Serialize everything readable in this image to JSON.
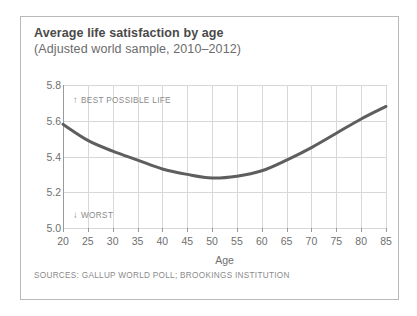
{
  "card": {
    "title": "Average life satisfaction by age",
    "subtitle": "(Adjusted world sample, 2010–2012)",
    "source": "SOURCES: GALLUP WORLD POLL; BROOKINGS INSTITUTION",
    "border_color": "#b9b9b9",
    "background": "#ffffff"
  },
  "annotations": {
    "top": {
      "arrow": "↑",
      "label": "BEST POSSIBLE LIFE"
    },
    "bottom": {
      "arrow": "↓",
      "label": "WORST"
    }
  },
  "chart_data": {
    "type": "line",
    "title": "Average life satisfaction by age",
    "subtitle": "(Adjusted world sample, 2010–2012)",
    "xlabel": "Age",
    "ylabel": "",
    "xlim": [
      20,
      85
    ],
    "ylim": [
      5.0,
      5.8
    ],
    "grid": true,
    "legend": false,
    "line_color": "#5e5e5e",
    "line_width": 3,
    "xticks": [
      20,
      25,
      30,
      35,
      40,
      45,
      50,
      55,
      60,
      65,
      70,
      75,
      80,
      85
    ],
    "xticklabels": [
      "20",
      "25",
      "30",
      "35",
      "40",
      "45",
      "50",
      "55",
      "60",
      "65",
      "70",
      "75",
      "80",
      "85"
    ],
    "yticks": [
      5.0,
      5.2,
      5.4,
      5.6,
      5.8
    ],
    "yticklabels": [
      "5.0",
      "5.2",
      "5.4",
      "5.6",
      "5.8"
    ],
    "series": [
      {
        "name": "Average life satisfaction",
        "x": [
          20,
          25,
          30,
          35,
          40,
          45,
          50,
          55,
          60,
          65,
          70,
          75,
          80,
          85
        ],
        "values": [
          5.58,
          5.49,
          5.43,
          5.38,
          5.33,
          5.3,
          5.28,
          5.29,
          5.32,
          5.38,
          5.45,
          5.53,
          5.61,
          5.68
        ]
      }
    ],
    "annotations": [
      {
        "text": "↑ BEST POSSIBLE LIFE",
        "x": 22,
        "y": 5.72
      },
      {
        "text": "↓ WORST",
        "x": 22,
        "y": 5.08
      }
    ]
  }
}
